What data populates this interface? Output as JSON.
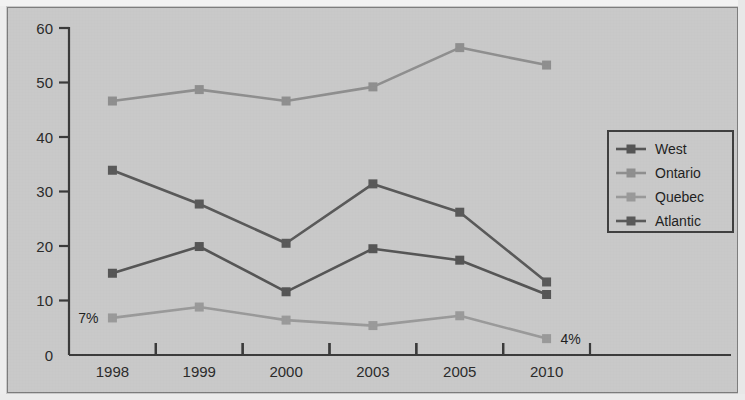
{
  "chart_data": {
    "type": "line",
    "title": "",
    "subtitle": "",
    "xlabel": "",
    "ylabel": "",
    "categories": [
      "1998",
      "1999",
      "2000",
      "2003",
      "2005",
      "2010"
    ],
    "ylim": [
      0,
      60
    ],
    "yticks": [
      "0",
      "10",
      "20",
      "30",
      "40",
      "50",
      "60"
    ],
    "ytick_values": [
      0,
      10,
      20,
      30,
      40,
      50,
      60
    ],
    "grid": false,
    "legend_position": "right",
    "series": [
      {
        "name": "West",
        "color": "#555555",
        "values": [
          15.0,
          19.9,
          11.6,
          19.5,
          17.4,
          11.1
        ]
      },
      {
        "name": "Ontario",
        "color": "#8f8f8f",
        "values": [
          46.6,
          48.7,
          46.6,
          49.2,
          56.4,
          53.2
        ]
      },
      {
        "name": "Quebec",
        "color": "#9a9a9a",
        "values": [
          6.8,
          8.8,
          6.4,
          5.4,
          7.2,
          3.0
        ]
      },
      {
        "name": "Atlantic",
        "color": "#595959",
        "values": [
          33.9,
          27.7,
          20.5,
          31.4,
          26.2,
          13.4
        ]
      }
    ],
    "annotations": [
      {
        "text": "7%",
        "series": "Quebec",
        "category": "1998",
        "position": "left"
      },
      {
        "text": "4%",
        "series": "Quebec",
        "category": "2010",
        "position": "right"
      }
    ]
  },
  "legend": {
    "items": [
      {
        "label": "West"
      },
      {
        "label": "Ontario"
      },
      {
        "label": "Quebec"
      },
      {
        "label": "Atlantic"
      }
    ]
  },
  "colors": {
    "background": "#c9c9c9",
    "frame": "#7d7d7d",
    "axis": "#3a3a3a",
    "text": "#1f1f1f"
  }
}
